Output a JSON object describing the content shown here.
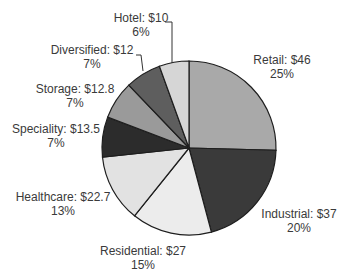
{
  "chart_data": {
    "type": "pie",
    "title": "",
    "unit_prefix": "$",
    "start_angle_deg": 0,
    "direction": "clockwise",
    "categories": [
      "Retail",
      "Industrial",
      "Residential",
      "Healthcare",
      "Speciality",
      "Storage",
      "Diversified",
      "Hotel"
    ],
    "values": [
      46,
      37,
      27,
      22.7,
      13.5,
      12.8,
      12,
      10
    ],
    "percents": [
      25,
      20,
      15,
      13,
      7,
      7,
      7,
      6
    ],
    "colors": [
      "#a9a9a9",
      "#3a3a3a",
      "#ececec",
      "#e2e2e2",
      "#2c2c2c",
      "#9a9a9a",
      "#5e5e5e",
      "#d6d6d6"
    ],
    "labels": [
      {
        "name": "Retail: $46",
        "pct": "25%",
        "x": 282,
        "y": 53
      },
      {
        "name": "Industrial: $37",
        "pct": "20%",
        "x": 299,
        "y": 207
      },
      {
        "name": "Residential: $27",
        "pct": "15%",
        "x": 143,
        "y": 244
      },
      {
        "name": "Healthcare: $22.7",
        "pct": "13%",
        "x": 63,
        "y": 190
      },
      {
        "name": "Speciality: $13.5",
        "pct": "7%",
        "x": 56,
        "y": 122
      },
      {
        "name": "Storage: $12.8",
        "pct": "7%",
        "x": 75,
        "y": 82
      },
      {
        "name": "Diversified: $12",
        "pct": "7%",
        "x": 92,
        "y": 43
      },
      {
        "name": "Hotel: $10",
        "pct": "6%",
        "x": 141,
        "y": 11
      }
    ],
    "leader_lines": [
      {
        "category": "Diversified",
        "points": [
          [
            136,
            55
          ],
          [
            141,
            55
          ],
          [
            143,
            71
          ]
        ]
      },
      {
        "category": "Hotel",
        "points": [
          [
            165,
            22
          ],
          [
            172,
            22
          ],
          [
            172,
            63
          ]
        ]
      }
    ]
  }
}
